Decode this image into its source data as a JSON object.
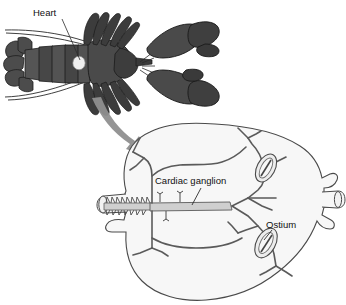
{
  "figure": {
    "background_color": "#ffffff"
  },
  "labels": {
    "heart": "Heart",
    "cardiac_ganglion": "Cardiac ganglion",
    "ostium": "Ostium"
  },
  "colors": {
    "lobster_body": "#4c4c4c",
    "lobster_body_dark": "#3b3b3b",
    "lobster_outline": "#222222",
    "heart_spot": "#efefef",
    "arrow": "#8f8f8f",
    "heart_fill": "#f7f7f7",
    "heart_outline": "#4a4a4a",
    "vessel_stroke": "#5a5a5a",
    "ganglion_fill": "#cfcfcf",
    "ostium_fill": "#ededed",
    "label_color": "#111111"
  },
  "panels": {
    "top": {
      "name": "lobster-dorsal-view",
      "description": "Dorsal view of a lobster with the heart highlighted in the thorax"
    },
    "bottom": {
      "name": "heart-detail-view",
      "description": "Enlarged view of the lobster heart showing the cardiac ganglion and ostia"
    }
  },
  "annotations": [
    {
      "id": "heart",
      "label": "Heart",
      "panel": "lobster-dorsal-view"
    },
    {
      "id": "cardiac-ganglion",
      "label": "Cardiac ganglion",
      "panel": "heart-detail-view"
    },
    {
      "id": "ostium",
      "label": "Ostium",
      "panel": "heart-detail-view"
    }
  ]
}
